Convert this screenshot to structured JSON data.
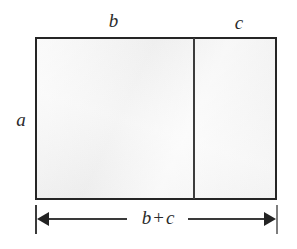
{
  "figure": {
    "type": "geometric-diagram",
    "background_color": "#ffffff",
    "fill_color": "#f2f2f2",
    "stroke_color": "#252525",
    "labels": {
      "top_left_segment": "b",
      "top_right_segment": "c",
      "left_side": "a",
      "baseline_dimension": {
        "first_term": "b",
        "operator": "+",
        "second_term": "c",
        "full_text": "b + c"
      }
    }
  }
}
